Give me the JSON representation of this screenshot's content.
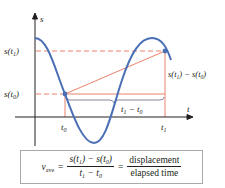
{
  "diagram": {
    "axes": {
      "y_label": "s",
      "x_label": "t"
    },
    "y_ticks": [
      {
        "label": "s(t",
        "sub": "1",
        "close": ")"
      },
      {
        "label": "s(t",
        "sub": "0",
        "close": ")"
      }
    ],
    "x_ticks": [
      {
        "label": "t",
        "sub": "0"
      },
      {
        "label": "t",
        "sub": "1"
      }
    ],
    "annotations": {
      "vertical_diff": {
        "a": "s(t",
        "a_sub": "1",
        "mid": ") − s(t",
        "b_sub": "0",
        "close": ")"
      },
      "horizontal_diff": {
        "a": "t",
        "a_sub": "1",
        "mid": " − t",
        "b_sub": "0"
      }
    },
    "colors": {
      "curve": "#4a6fb5",
      "secant": "#e8735a",
      "guides": "#e8735a",
      "axis": "#231f20",
      "brace": "#6a6a8a",
      "box_border": "#a7a9ac"
    }
  },
  "formula": {
    "lhs_var": "v",
    "lhs_sub": "ave",
    "eq1": "=",
    "num": {
      "a": "s(t",
      "a_sub": "1",
      "mid": ") − s(t",
      "b_sub": "0",
      "close": ")"
    },
    "den": {
      "a": "t",
      "a_sub": "1",
      "mid": " − t",
      "b_sub": "0"
    },
    "eq2": "=",
    "word_num": "displacement",
    "word_den": "elapsed time"
  }
}
